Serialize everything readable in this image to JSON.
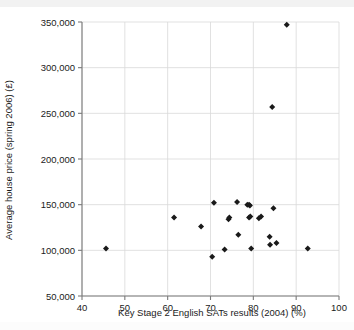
{
  "figure": {
    "background_color": "#ffffff",
    "top_band_color": "#f2f2f2",
    "point_color": "#1a1a1a",
    "grid_color": "#d9d9d9",
    "axis_color": "#7a7a7a"
  },
  "axes": {
    "x_title": "Key Stage 2 English SATs results (2004) (%)",
    "y_title": "Average house price (spring 2006) (£)",
    "x_ticks": [
      "40",
      "50",
      "60",
      "70",
      "80",
      "90",
      "100"
    ],
    "y_ticks": [
      "50,000",
      "100,000",
      "150,000",
      "200,000",
      "250,000",
      "300,000",
      "350,000"
    ]
  },
  "chart_data": {
    "type": "scatter",
    "title": "",
    "subtitle": "",
    "xlabel": "Key Stage 2 English SATs results (2004) (%)",
    "ylabel": "Average house price (spring 2006) (£)",
    "xlim": [
      40,
      100
    ],
    "ylim": [
      50000,
      350000
    ],
    "xticks": [
      40,
      50,
      60,
      70,
      80,
      90,
      100
    ],
    "yticks": [
      50000,
      100000,
      150000,
      200000,
      250000,
      300000,
      350000
    ],
    "grid": true,
    "legend": null,
    "marker": "diamond",
    "series": [
      {
        "name": "Local authority areas",
        "points": [
          {
            "x": 45.6,
            "y": 102000
          },
          {
            "x": 61.5,
            "y": 136000
          },
          {
            "x": 67.8,
            "y": 126000
          },
          {
            "x": 70.4,
            "y": 93000
          },
          {
            "x": 70.8,
            "y": 152000
          },
          {
            "x": 73.3,
            "y": 101000
          },
          {
            "x": 74.2,
            "y": 134000
          },
          {
            "x": 74.4,
            "y": 136000
          },
          {
            "x": 76.2,
            "y": 153000
          },
          {
            "x": 76.5,
            "y": 117000
          },
          {
            "x": 78.6,
            "y": 150000
          },
          {
            "x": 79.0,
            "y": 150000
          },
          {
            "x": 79.2,
            "y": 149000
          },
          {
            "x": 79.0,
            "y": 136000
          },
          {
            "x": 79.3,
            "y": 137000
          },
          {
            "x": 79.5,
            "y": 102000
          },
          {
            "x": 81.3,
            "y": 135000
          },
          {
            "x": 81.8,
            "y": 137000
          },
          {
            "x": 83.8,
            "y": 115000
          },
          {
            "x": 83.9,
            "y": 106000
          },
          {
            "x": 84.4,
            "y": 257000
          },
          {
            "x": 84.7,
            "y": 146000
          },
          {
            "x": 85.4,
            "y": 108000
          },
          {
            "x": 87.8,
            "y": 347000
          },
          {
            "x": 92.7,
            "y": 102000
          }
        ]
      }
    ]
  }
}
